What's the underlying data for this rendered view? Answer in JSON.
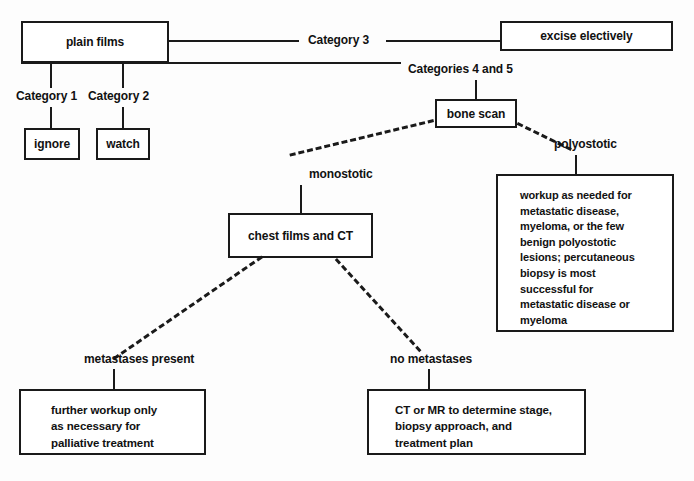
{
  "diagram": {
    "colors": {
      "stroke": "#1a1a1a",
      "text": "#111111",
      "background": "#ffffff"
    },
    "nodes": {
      "plain_films": "plain films",
      "excise_electively": "excise electively",
      "ignore": "ignore",
      "watch": "watch",
      "bone_scan": "bone scan",
      "chest_films_ct": "chest films and CT",
      "polyostotic_workup_lines": [
        "workup  as needed for",
        "metastatic disease,",
        "myeloma, or the few",
        "benign polyostotic",
        "lesions; percutaneous",
        "biopsy is most",
        "successful for",
        "metastatic disease or",
        "myeloma"
      ],
      "metastases_present_lines": [
        "further workup  only",
        "as necessary for",
        "palliative treatment"
      ],
      "no_metastases_lines": [
        "CT or MR to determine stage,",
        "biopsy approach, and",
        "treatment plan"
      ]
    },
    "edge_labels": {
      "category_1": "Category 1",
      "category_2": "Category 2",
      "category_3": "Category 3",
      "categories_4_and_5": "Categories 4 and 5",
      "monostotic": "monostotic",
      "polyostotic": "polyostotic",
      "metastases_present": "metastases present",
      "no_metastases": "no metastases"
    }
  }
}
